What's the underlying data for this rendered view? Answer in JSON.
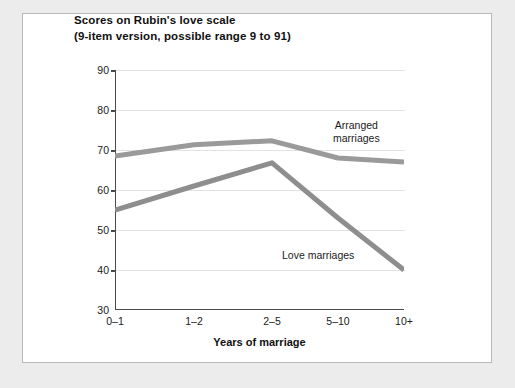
{
  "figure": {
    "title": "Scores on Rubin's love scale",
    "subtitle": "(9-item version, possible range 9 to 91)"
  },
  "chart_data": {
    "type": "line",
    "title": "Scores on Rubin's love scale",
    "subtitle": "(9-item version, possible range 9 to 91)",
    "xlabel": "Years of marriage",
    "ylabel": "",
    "categories": [
      "0–1",
      "1–2",
      "2–5",
      "5–10",
      "10+"
    ],
    "ylim": [
      30,
      90
    ],
    "yticks": [
      30,
      40,
      50,
      60,
      70,
      80,
      90
    ],
    "grid": true,
    "legend_position": "inline-annotations",
    "series": [
      {
        "name": "Arranged marriages",
        "color": "#9a9a9a",
        "values": [
          68.5,
          71.3,
          72.3,
          68.0,
          67.0
        ],
        "label_lines": [
          "Arranged",
          "marriages"
        ]
      },
      {
        "name": "Love marriages",
        "color": "#8e8e8e",
        "values": [
          55.0,
          61.0,
          66.8,
          53.0,
          40.0
        ],
        "label_lines": [
          "Love marriages"
        ]
      }
    ]
  },
  "axis": {
    "y_tick_labels": [
      "90",
      "80",
      "70",
      "60",
      "50",
      "40",
      "30"
    ],
    "x_tick_labels": [
      "0–1",
      "1–2",
      "2–5",
      "5–10",
      "10+"
    ],
    "x_title": "Years of marriage"
  },
  "annotations": {
    "arranged_line1": "Arranged",
    "arranged_line2": "marriages",
    "love_line1": "Love marriages"
  },
  "colors": {
    "line_arranged": "#9a9a9a",
    "line_love": "#8e8e8e",
    "axis": "#4a4a4a",
    "grid": "#e2e2e2",
    "page_background": "#ececed",
    "panel_background": "#ffffff"
  }
}
